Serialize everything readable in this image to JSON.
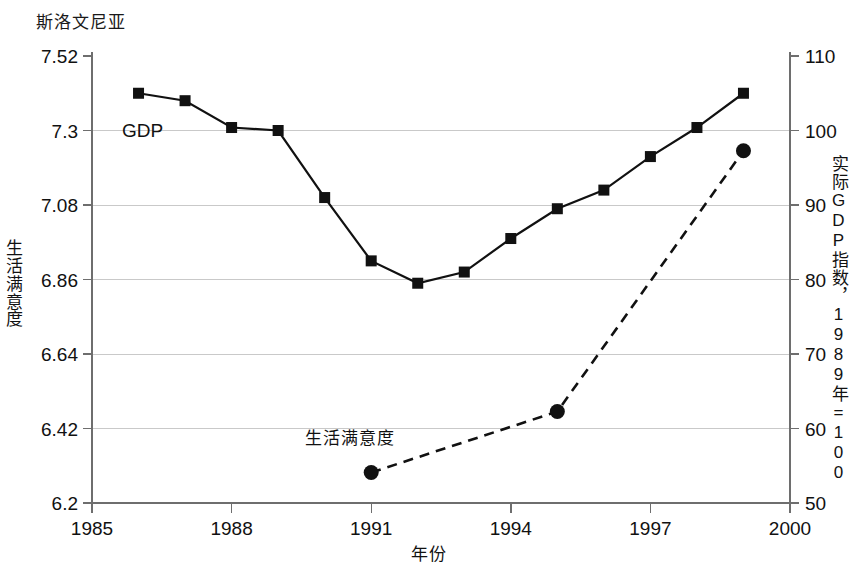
{
  "title": "斯洛文尼亚",
  "axes": {
    "x": {
      "label": "年份",
      "ticks": [
        "1985",
        "1988",
        "1991",
        "1994",
        "1997",
        "2000"
      ],
      "min": 1985,
      "max": 2000
    },
    "y_left": {
      "label": "生活满意度",
      "label_chars": [
        "生",
        "活",
        "满",
        "意",
        "度"
      ],
      "ticks": [
        "7.52",
        "7.3",
        "7.08",
        "6.86",
        "6.64",
        "6.42",
        "6.2"
      ],
      "min": 6.2,
      "max": 7.52
    },
    "y_right": {
      "label": "实际GDP指数，1989年=100",
      "ticks": [
        "110",
        "100",
        "90",
        "80",
        "70",
        "60",
        "50"
      ],
      "min": 50,
      "max": 110
    }
  },
  "series_labels": {
    "gdp": "GDP",
    "life_satisfaction": "生活满意度"
  },
  "colors": {
    "ink": "#111111",
    "grid": "#c9c9c9",
    "axis": "#6e6e6e"
  },
  "chart_data": {
    "type": "line",
    "title": "斯洛文尼亚",
    "xlabel": "年份",
    "ylabel": "生活满意度",
    "y2label": "实际GDP指数，1989年=100",
    "xlim": [
      1985,
      2000
    ],
    "ylim": [
      6.2,
      7.52
    ],
    "y2lim": [
      50,
      110
    ],
    "grid": true,
    "legend": "inline-annotations",
    "series": [
      {
        "name": "GDP",
        "axis": "right",
        "marker": "square",
        "line_style": "solid",
        "points": [
          {
            "x": 1986,
            "y": 105.0
          },
          {
            "x": 1987,
            "y": 104.0
          },
          {
            "x": 1988,
            "y": 100.4
          },
          {
            "x": 1989,
            "y": 100.0
          },
          {
            "x": 1990,
            "y": 91.0
          },
          {
            "x": 1991,
            "y": 82.5
          },
          {
            "x": 1992,
            "y": 79.5
          },
          {
            "x": 1993,
            "y": 81.0
          },
          {
            "x": 1994,
            "y": 85.5
          },
          {
            "x": 1995,
            "y": 89.5
          },
          {
            "x": 1996,
            "y": 92.0
          },
          {
            "x": 1997,
            "y": 96.5
          },
          {
            "x": 1998,
            "y": 100.4
          },
          {
            "x": 1999,
            "y": 105.0
          }
        ]
      },
      {
        "name": "生活满意度",
        "axis": "left",
        "marker": "circle",
        "line_style": "dashed",
        "points": [
          {
            "x": 1991,
            "y": 6.29
          },
          {
            "x": 1995,
            "y": 6.47
          },
          {
            "x": 1999,
            "y": 7.24
          }
        ]
      }
    ]
  }
}
